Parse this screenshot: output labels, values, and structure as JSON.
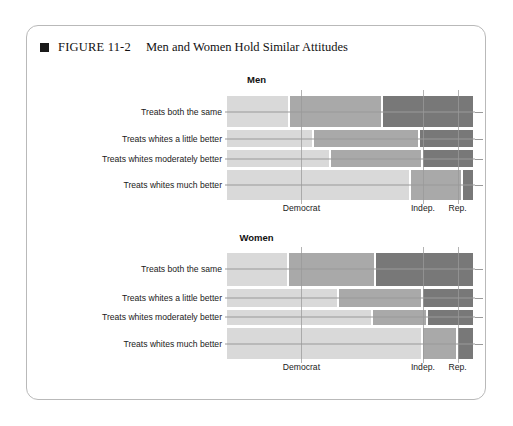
{
  "figure": {
    "marker": "square-bullet",
    "number": "FIGURE 11-2",
    "title": "Men and Women Hold Similar Attitudes"
  },
  "colors": {
    "light": "#d9d9d9",
    "medium": "#a9a9a9",
    "dark": "#787878",
    "gridline": "#9a9a9a",
    "frame": "#b9b9b9",
    "text": "#1a1a1a"
  },
  "chart_data": {
    "type": "bar",
    "subtype": "mosaic-spine-plot",
    "title": "Men and Women Hold Similar Attitudes",
    "xlabel": "",
    "ylabel": "",
    "grid": false,
    "legend": "none",
    "x_categories": [
      "Democrat",
      "Indep.",
      "Rep."
    ],
    "y_categories": [
      "Treats both the same",
      "Treats whites a little better",
      "Treats whites moderately better",
      "Treats whites much better"
    ],
    "x_tick_labels": [
      "Democrat",
      "Indep.",
      "Rep."
    ],
    "x_tick_positions_pct": [
      30,
      79,
      93
    ],
    "panels": [
      {
        "name": "Men",
        "rows": [
          {
            "label": "Treats both the same",
            "height_pct": 31.5,
            "segments": [
              {
                "party": "Democrat",
                "width_pct": 25.5,
                "color": "light"
              },
              {
                "party": "Indep.",
                "width_pct": 37.5,
                "color": "medium"
              },
              {
                "party": "Rep.",
                "width_pct": 37.0,
                "color": "dark"
              }
            ]
          },
          {
            "label": "Treats whites a little better",
            "height_pct": 17.5,
            "segments": [
              {
                "party": "Democrat",
                "width_pct": 35.0,
                "color": "light"
              },
              {
                "party": "Indep.",
                "width_pct": 43.0,
                "color": "medium"
              },
              {
                "party": "Rep.",
                "width_pct": 22.0,
                "color": "dark"
              }
            ]
          },
          {
            "label": "Treats whites moderately better",
            "height_pct": 17.0,
            "segments": [
              {
                "party": "Democrat",
                "width_pct": 42.0,
                "color": "light"
              },
              {
                "party": "Indep.",
                "width_pct": 37.0,
                "color": "medium"
              },
              {
                "party": "Rep.",
                "width_pct": 21.0,
                "color": "dark"
              }
            ]
          },
          {
            "label": "Treats whites much better",
            "height_pct": 30.0,
            "segments": [
              {
                "party": "Democrat",
                "width_pct": 74.0,
                "color": "light"
              },
              {
                "party": "Indep.",
                "width_pct": 21.0,
                "color": "medium"
              },
              {
                "party": "Rep.",
                "width_pct": 5.0,
                "color": "dark"
              }
            ]
          }
        ]
      },
      {
        "name": "Women",
        "rows": [
          {
            "label": "Treats both the same",
            "height_pct": 32.5,
            "segments": [
              {
                "party": "Democrat",
                "width_pct": 25.0,
                "color": "light"
              },
              {
                "party": "Indep.",
                "width_pct": 35.0,
                "color": "medium"
              },
              {
                "party": "Rep.",
                "width_pct": 40.0,
                "color": "dark"
              }
            ]
          },
          {
            "label": "Treats whites a little better",
            "height_pct": 18.0,
            "segments": [
              {
                "party": "Democrat",
                "width_pct": 45.0,
                "color": "light"
              },
              {
                "party": "Indep.",
                "width_pct": 34.0,
                "color": "medium"
              },
              {
                "party": "Rep.",
                "width_pct": 21.0,
                "color": "dark"
              }
            ]
          },
          {
            "label": "Treats whites moderately better",
            "height_pct": 15.5,
            "segments": [
              {
                "party": "Democrat",
                "width_pct": 59.0,
                "color": "light"
              },
              {
                "party": "Indep.",
                "width_pct": 22.0,
                "color": "medium"
              },
              {
                "party": "Rep.",
                "width_pct": 19.0,
                "color": "dark"
              }
            ]
          },
          {
            "label": "Treats whites much better",
            "height_pct": 31.0,
            "segments": [
              {
                "party": "Democrat",
                "width_pct": 79.0,
                "color": "light"
              },
              {
                "party": "Indep.",
                "width_pct": 14.0,
                "color": "medium"
              },
              {
                "party": "Rep.",
                "width_pct": 7.0,
                "color": "dark"
              }
            ]
          }
        ]
      }
    ]
  }
}
